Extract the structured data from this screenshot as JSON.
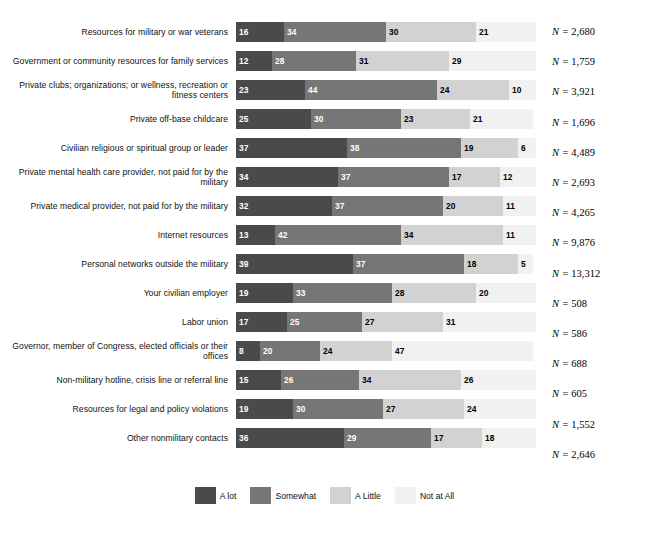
{
  "chart_data": {
    "type": "bar",
    "subtype": "stacked-horizontal-100pct",
    "title": "",
    "xlabel": "",
    "ylabel": "",
    "xlim": [
      0,
      100
    ],
    "grid": false,
    "legend_position": "bottom",
    "legend": [
      "A lot",
      "Somewhat",
      "A Little",
      "Not at All"
    ],
    "colors": {
      "A lot": "#4a4a4a",
      "Somewhat": "#767676",
      "A Little": "#d2d2d2",
      "Not at All": "#f1f1f1"
    },
    "categories": [
      "Resources for military or war veterans",
      "Government or community resources for family services",
      "Private clubs; organizations; or wellness, recreation or fitness centers",
      "Private off-base childcare",
      "Civilian religious or spiritual group or leader",
      "Private mental health care provider, not paid for by the military",
      "Private medical provider, not paid for by the military",
      "Internet resources",
      "Personal networks outside the military",
      "Your civilian employer",
      "Labor union",
      "Governor, member of Congress, elected officials or their offices",
      "Non-military hotline, crisis line or referral line",
      "Resources for legal and policy violations",
      "Other nonmilitary contacts"
    ],
    "series": [
      {
        "name": "A lot",
        "values": [
          16,
          12,
          23,
          25,
          37,
          34,
          32,
          13,
          39,
          19,
          17,
          8,
          15,
          19,
          36
        ]
      },
      {
        "name": "Somewhat",
        "values": [
          34,
          28,
          44,
          30,
          38,
          37,
          37,
          42,
          37,
          33,
          25,
          20,
          26,
          30,
          29
        ]
      },
      {
        "name": "A Little",
        "values": [
          30,
          31,
          24,
          23,
          19,
          17,
          20,
          34,
          18,
          28,
          27,
          24,
          34,
          27,
          17
        ]
      },
      {
        "name": "Not at All",
        "values": [
          21,
          29,
          10,
          21,
          6,
          12,
          11,
          11,
          5,
          20,
          31,
          47,
          26,
          24,
          18
        ]
      }
    ],
    "n_labels": [
      "2,680",
      "1,759",
      "3,921",
      "1,696",
      "4,489",
      "2,693",
      "4,265",
      "9,876",
      "13,312",
      "508",
      "586",
      "688",
      "605",
      "1,552",
      "2,646"
    ],
    "n_prefix": "N = "
  }
}
